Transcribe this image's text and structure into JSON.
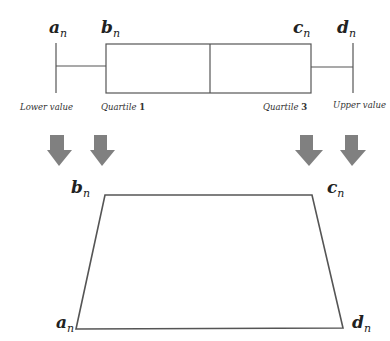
{
  "colors": {
    "line": "#555555",
    "arrow": "#808080",
    "text": "#222222",
    "background": "#ffffff"
  },
  "boxplot": {
    "labels": {
      "a": {
        "base": "a",
        "sub": "n"
      },
      "b": {
        "base": "b",
        "sub": "n"
      },
      "c": {
        "base": "c",
        "sub": "n"
      },
      "d": {
        "base": "d",
        "sub": "n"
      }
    },
    "captions": {
      "lower": "Lower value",
      "q1_text": "Quartile",
      "q1_num": "1",
      "q3_text": "Quartile",
      "q3_num": "3",
      "upper": "Upper value"
    }
  },
  "arrows": [
    {
      "name": "arrow-a"
    },
    {
      "name": "arrow-b"
    },
    {
      "name": "arrow-c"
    },
    {
      "name": "arrow-d"
    }
  ],
  "trapezoid": {
    "labels": {
      "a": {
        "base": "a",
        "sub": "n"
      },
      "b": {
        "base": "b",
        "sub": "n"
      },
      "c": {
        "base": "c",
        "sub": "n"
      },
      "d": {
        "base": "d",
        "sub": "n"
      }
    }
  }
}
